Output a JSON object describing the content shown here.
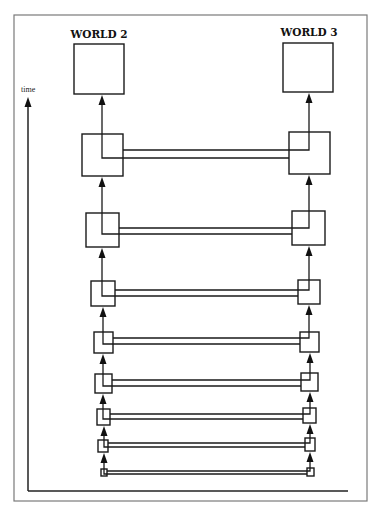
{
  "diagram": {
    "worlds": [
      {
        "label": "WORLD 2"
      },
      {
        "label": "WORLD 3"
      }
    ],
    "axis": {
      "label": "time"
    },
    "levels": 8,
    "colors": {
      "frame": "#7a7a7a",
      "lines": "#1a1a1a",
      "background": "#ffffff"
    }
  }
}
